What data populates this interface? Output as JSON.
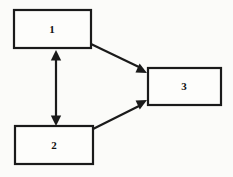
{
  "diagram": {
    "background_color": "#fbfbf9",
    "stroke_color": "#1a1a1a",
    "box_fill_color": "#fdfdfb",
    "nodes": [
      {
        "id": "node-1",
        "label": "1",
        "x": 14,
        "y": 10,
        "width": 77,
        "height": 38,
        "label_x": 52,
        "label_y": 30
      },
      {
        "id": "node-2",
        "label": "2",
        "x": 15,
        "y": 126,
        "width": 78,
        "height": 38,
        "label_x": 54,
        "label_y": 146
      },
      {
        "id": "node-3",
        "label": "3",
        "x": 148,
        "y": 68,
        "width": 73,
        "height": 37,
        "label_x": 184,
        "label_y": 87
      }
    ],
    "edges": [
      {
        "id": "edge-1-to-3",
        "from": "node-1",
        "to": "node-3",
        "label": "",
        "arrowheads": "end",
        "x1": 91,
        "y1": 44,
        "x2": 147,
        "y2": 73
      },
      {
        "id": "edge-2-to-3",
        "from": "node-2",
        "to": "node-3",
        "label": "",
        "arrowheads": "end",
        "x1": 93,
        "y1": 129,
        "x2": 147,
        "y2": 100
      },
      {
        "id": "edge-1-to-2-bidirectional",
        "from": "node-1",
        "to": "node-2",
        "label": "",
        "arrowheads": "both",
        "x1": 56,
        "y1": 50,
        "x2": 56,
        "y2": 126
      }
    ]
  }
}
